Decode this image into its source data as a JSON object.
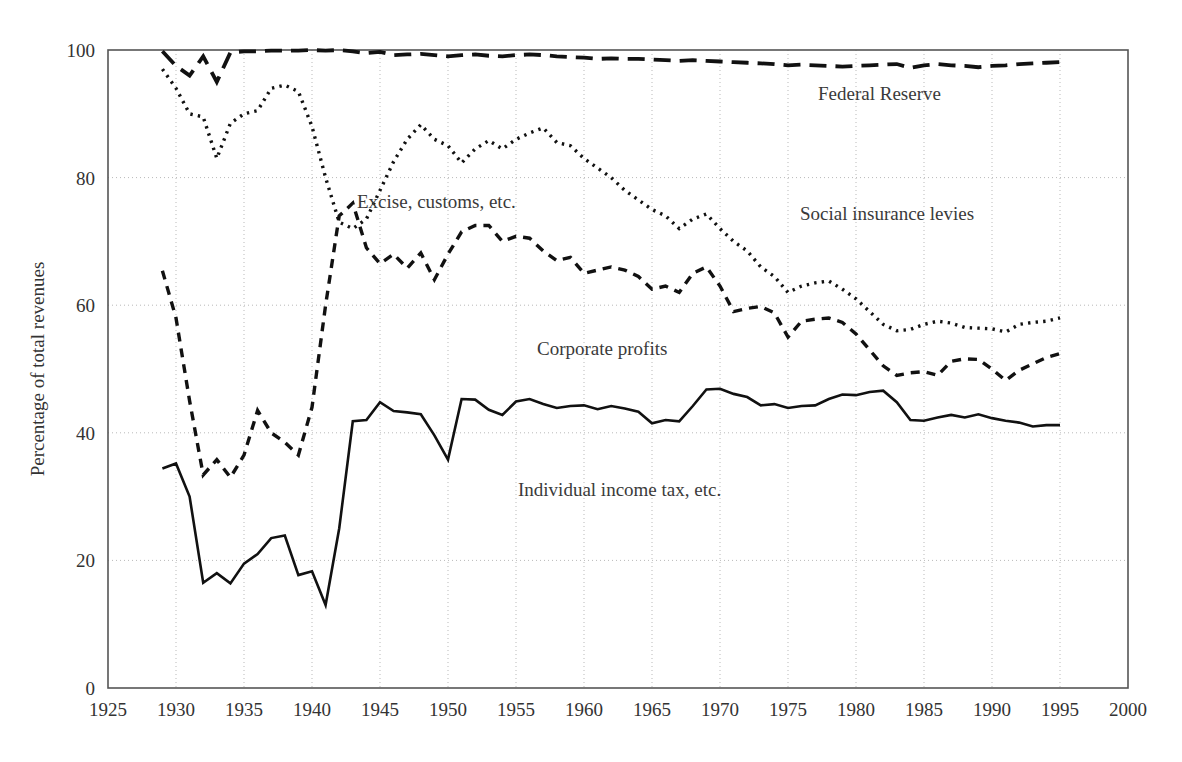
{
  "chart_data": {
    "type": "line",
    "title": "",
    "subtitle": "",
    "xlabel": "",
    "ylabel": "Percentage of total revenues",
    "xlim": [
      1925,
      2000
    ],
    "ylim": [
      0,
      100
    ],
    "xticks": [
      1925,
      1930,
      1935,
      1940,
      1945,
      1950,
      1955,
      1960,
      1965,
      1970,
      1975,
      1980,
      1985,
      1990,
      1995,
      2000
    ],
    "yticks": [
      0,
      20,
      40,
      60,
      80,
      100
    ],
    "grid": "dotted-both-axes",
    "legend_position": "inline-annotations",
    "x": [
      1929,
      1930,
      1931,
      1932,
      1933,
      1934,
      1935,
      1936,
      1937,
      1938,
      1939,
      1940,
      1941,
      1942,
      1943,
      1944,
      1945,
      1946,
      1947,
      1948,
      1949,
      1950,
      1951,
      1952,
      1953,
      1954,
      1955,
      1956,
      1957,
      1958,
      1959,
      1960,
      1961,
      1962,
      1963,
      1964,
      1965,
      1966,
      1967,
      1968,
      1969,
      1970,
      1971,
      1972,
      1973,
      1974,
      1975,
      1976,
      1977,
      1978,
      1979,
      1980,
      1981,
      1982,
      1983,
      1984,
      1985,
      1986,
      1987,
      1988,
      1989,
      1990,
      1991,
      1992,
      1993,
      1994,
      1995
    ],
    "series": [
      {
        "name": "Individual income tax, etc.",
        "style": "solid",
        "values": [
          34.4,
          35.2,
          30.0,
          16.5,
          18.0,
          16.4,
          19.5,
          21.0,
          23.5,
          23.9,
          17.7,
          18.3,
          13.0,
          25.0,
          41.8,
          42.0,
          44.8,
          43.4,
          43.2,
          42.9,
          39.6,
          35.8,
          45.3,
          45.2,
          43.6,
          42.8,
          44.9,
          45.3,
          44.5,
          43.9,
          44.2,
          44.3,
          43.7,
          44.2,
          43.8,
          43.3,
          41.5,
          42.0,
          41.8,
          44.2,
          46.8,
          46.9,
          46.1,
          45.6,
          44.3,
          44.5,
          43.9,
          44.2,
          44.3,
          45.3,
          46.0,
          45.9,
          46.4,
          46.6,
          44.8,
          42.0,
          41.9,
          42.4,
          42.8,
          42.4,
          42.9,
          42.3,
          41.9,
          41.6,
          41.0,
          41.2,
          41.2
        ]
      },
      {
        "name": "Corporate profits",
        "style": "dashed-short",
        "values": [
          65.4,
          58.0,
          45.0,
          33.4,
          35.8,
          33.0,
          36.5,
          43.5,
          40.0,
          38.5,
          36.5,
          44.0,
          60.0,
          74.0,
          76.0,
          69.0,
          66.5,
          68.0,
          65.8,
          68.2,
          64.0,
          68.0,
          71.5,
          72.5,
          72.5,
          70.0,
          70.8,
          70.5,
          68.5,
          67.0,
          67.5,
          65.0,
          65.5,
          66.0,
          65.5,
          64.5,
          62.5,
          63.0,
          62.0,
          65.0,
          66.0,
          63.0,
          59.0,
          59.5,
          59.8,
          58.8,
          55.0,
          57.5,
          57.8,
          58.0,
          57.3,
          55.5,
          53.0,
          50.5,
          49.0,
          49.4,
          49.6,
          49.0,
          51.2,
          51.6,
          51.5,
          50.0,
          48.2,
          49.8,
          50.8,
          51.8,
          52.4
        ]
      },
      {
        "name": "Social insurance levies",
        "style": "dotted",
        "values": [
          97.0,
          94.0,
          90.0,
          89.5,
          83.0,
          88.5,
          90.0,
          90.5,
          94.0,
          94.5,
          93.5,
          88.0,
          80.0,
          73.0,
          72.0,
          73.5,
          78.0,
          82.5,
          86.0,
          88.3,
          86.0,
          85.0,
          82.3,
          84.5,
          85.8,
          84.5,
          86.0,
          87.0,
          87.8,
          85.5,
          85.0,
          83.0,
          81.5,
          80.0,
          78.0,
          76.5,
          75.0,
          74.0,
          72.0,
          73.5,
          74.3,
          72.0,
          70.0,
          68.5,
          66.0,
          64.5,
          62.0,
          63.0,
          63.5,
          63.8,
          62.5,
          61.0,
          59.0,
          57.0,
          56.0,
          56.2,
          57.0,
          57.5,
          57.2,
          56.5,
          56.4,
          56.3,
          55.8,
          57.0,
          57.3,
          57.5,
          58.0
        ]
      },
      {
        "name": "Federal Reserve",
        "style": "dashed-long",
        "values": [
          99.8,
          97.5,
          96.0,
          99.0,
          95.0,
          99.6,
          99.8,
          99.8,
          99.9,
          99.9,
          99.9,
          100.0,
          99.9,
          100.0,
          99.8,
          99.5,
          99.7,
          99.2,
          99.3,
          99.4,
          99.2,
          99.0,
          99.2,
          99.3,
          99.1,
          99.0,
          99.2,
          99.3,
          99.2,
          99.0,
          98.9,
          98.8,
          98.6,
          98.7,
          98.6,
          98.6,
          98.5,
          98.4,
          98.3,
          98.4,
          98.3,
          98.2,
          98.1,
          98.0,
          97.9,
          97.8,
          97.6,
          97.7,
          97.6,
          97.5,
          97.4,
          97.5,
          97.6,
          97.7,
          97.8,
          97.2,
          97.6,
          97.8,
          97.6,
          97.5,
          97.3,
          97.5,
          97.6,
          97.8,
          97.9,
          98.0,
          98.1
        ]
      }
    ],
    "annotations": [
      {
        "name": "federal-reserve-label",
        "text": "Federal Reserve",
        "x_px": 818,
        "y_px": 100
      },
      {
        "name": "social-insurance-label",
        "text": "Social insurance levies",
        "x_px": 800,
        "y_px": 220
      },
      {
        "name": "excise-customs-label",
        "text": "Excise, customs, etc.",
        "x_px": 357,
        "y_px": 208
      },
      {
        "name": "corporate-profits-label",
        "text": "Corporate profits",
        "x_px": 537,
        "y_px": 355
      },
      {
        "name": "individual-income-label",
        "text": "Individual income tax, etc.",
        "x_px": 518,
        "y_px": 496
      }
    ],
    "colors": {
      "line": "#111111",
      "grid": "#b9b9b9",
      "axis": "#555555",
      "text": "#333333",
      "background": "#ffffff"
    }
  }
}
